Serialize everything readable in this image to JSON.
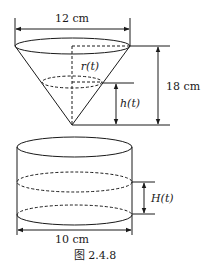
{
  "figure": {
    "caption": "图 2.4.8",
    "cone": {
      "top_diameter_label": "12 cm",
      "height_label": "18 cm",
      "radius_label": "r(t)",
      "water_height_label": "h(t)"
    },
    "cylinder": {
      "diameter_label": "10 cm",
      "water_height_label": "H(t)"
    }
  }
}
